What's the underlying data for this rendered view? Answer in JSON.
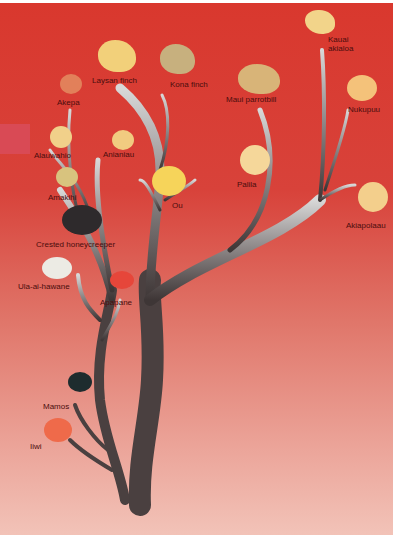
{
  "diagram": {
    "type": "phylogenetic-tree",
    "colors": {
      "background_top": "#d9382e",
      "background_bottom": "#f2c3b8",
      "trunk": "#4a4040",
      "branch_tip": "#d8d8d8",
      "label": "#4a0d0d"
    },
    "species": [
      {
        "id": "kauai-akialoa",
        "label_line1": "Kauai",
        "label_line2": "akialoa"
      },
      {
        "id": "laysan-finch",
        "label": "Laysan finch"
      },
      {
        "id": "kona-finch",
        "label": "Kona finch"
      },
      {
        "id": "maui-parrotbill",
        "label": "Maui parrotbill"
      },
      {
        "id": "nukupuu",
        "label": "Nukupuu"
      },
      {
        "id": "akepa",
        "label": "Akepa"
      },
      {
        "id": "alauwahio",
        "label": "Alauwahio"
      },
      {
        "id": "anianiau",
        "label": "Anianiau"
      },
      {
        "id": "palila",
        "label": "Palila"
      },
      {
        "id": "amakihi",
        "label": "Amakihi"
      },
      {
        "id": "ou",
        "label": "Ou"
      },
      {
        "id": "akiapolaau",
        "label": "Akiapolaau"
      },
      {
        "id": "crested-honeycreeper",
        "label": "Crested honeycreeper"
      },
      {
        "id": "ula-ai-hawane",
        "label": "Ula-ai-hawane"
      },
      {
        "id": "apapane",
        "label": "Apapane"
      },
      {
        "id": "mamos",
        "label": "Mamos"
      },
      {
        "id": "iiwi",
        "label": "Iiwi"
      }
    ]
  }
}
